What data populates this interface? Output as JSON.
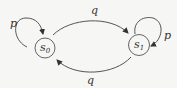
{
  "diagram": {
    "type": "state-transition",
    "states": [
      {
        "id": "s0",
        "label": "s",
        "subscript": "0"
      },
      {
        "id": "s1",
        "label": "s",
        "subscript": "1"
      }
    ],
    "transitions": [
      {
        "from": "s0",
        "to": "s0",
        "label": "p"
      },
      {
        "from": "s0",
        "to": "s1",
        "label": "q"
      },
      {
        "from": "s1",
        "to": "s1",
        "label": "p"
      },
      {
        "from": "s1",
        "to": "s0",
        "label": "q"
      }
    ],
    "colors": {
      "stroke": "#555555",
      "text": "#333333",
      "background": "#f6f6f4"
    }
  }
}
